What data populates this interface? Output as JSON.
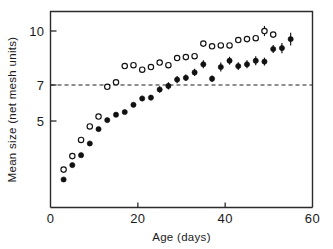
{
  "chart_data": {
    "type": "scatter",
    "title": "",
    "xlabel": "Age (days)",
    "ylabel": "Mean size (net mesh units)",
    "xlim": [
      0,
      60
    ],
    "ylim": [
      1.0,
      10.6
    ],
    "xticks": [
      0,
      20,
      40,
      60
    ],
    "xticklabels": [
      "0",
      "20",
      "40",
      "60"
    ],
    "yticks": [
      5,
      7,
      10
    ],
    "yticklabels": [
      "5",
      "7",
      "10"
    ],
    "grid": false,
    "legend": "none",
    "annotations": [
      {
        "kind": "horizontal-reference-line",
        "y": 7,
        "style": "dashed",
        "label": "7"
      }
    ],
    "series": [
      {
        "name": "open-circles",
        "marker": "open-circle",
        "color": "#111111",
        "points": [
          {
            "x": 3,
            "y": 2.3,
            "err": 0.0
          },
          {
            "x": 5,
            "y": 3.05,
            "err": 0.0
          },
          {
            "x": 7,
            "y": 3.95,
            "err": 0.0
          },
          {
            "x": 9,
            "y": 4.7,
            "err": 0.0
          },
          {
            "x": 11,
            "y": 5.25,
            "err": 0.0
          },
          {
            "x": 13,
            "y": 6.9,
            "err": 0.0
          },
          {
            "x": 15,
            "y": 7.15,
            "err": 0.0
          },
          {
            "x": 17,
            "y": 8.05,
            "err": 0.0
          },
          {
            "x": 19,
            "y": 8.1,
            "err": 0.0
          },
          {
            "x": 21,
            "y": 7.85,
            "err": 0.0
          },
          {
            "x": 23,
            "y": 8.0,
            "err": 0.0
          },
          {
            "x": 25,
            "y": 8.25,
            "err": 0.0
          },
          {
            "x": 27,
            "y": 8.1,
            "err": 0.0
          },
          {
            "x": 29,
            "y": 8.5,
            "err": 0.0
          },
          {
            "x": 31,
            "y": 8.55,
            "err": 0.0
          },
          {
            "x": 33,
            "y": 8.6,
            "err": 0.0
          },
          {
            "x": 35,
            "y": 9.3,
            "err": 0.0
          },
          {
            "x": 37,
            "y": 9.15,
            "err": 0.0
          },
          {
            "x": 39,
            "y": 9.2,
            "err": 0.0
          },
          {
            "x": 41,
            "y": 9.2,
            "err": 0.0
          },
          {
            "x": 43,
            "y": 9.5,
            "err": 0.0
          },
          {
            "x": 45,
            "y": 9.55,
            "err": 0.0
          },
          {
            "x": 47,
            "y": 9.6,
            "err": 0.0
          },
          {
            "x": 49,
            "y": 10.0,
            "err": 0.28
          },
          {
            "x": 51,
            "y": 9.8,
            "err": 0.0
          }
        ]
      },
      {
        "name": "filled-circles",
        "marker": "filled-circle",
        "color": "#111111",
        "points": [
          {
            "x": 3,
            "y": 1.75,
            "err": 0.0
          },
          {
            "x": 5,
            "y": 2.55,
            "err": 0.0
          },
          {
            "x": 7,
            "y": 3.1,
            "err": 0.0
          },
          {
            "x": 9,
            "y": 3.75,
            "err": 0.0
          },
          {
            "x": 11,
            "y": 4.55,
            "err": 0.0
          },
          {
            "x": 13,
            "y": 5.05,
            "err": 0.0
          },
          {
            "x": 15,
            "y": 5.35,
            "err": 0.0
          },
          {
            "x": 17,
            "y": 5.5,
            "err": 0.0
          },
          {
            "x": 19,
            "y": 5.9,
            "err": 0.12
          },
          {
            "x": 21,
            "y": 6.25,
            "err": 0.15
          },
          {
            "x": 23,
            "y": 6.3,
            "err": 0.15
          },
          {
            "x": 25,
            "y": 6.75,
            "err": 0.18
          },
          {
            "x": 27,
            "y": 6.95,
            "err": 0.2
          },
          {
            "x": 29,
            "y": 7.3,
            "err": 0.2
          },
          {
            "x": 31,
            "y": 7.4,
            "err": 0.18
          },
          {
            "x": 33,
            "y": 7.7,
            "err": 0.2
          },
          {
            "x": 35,
            "y": 8.15,
            "err": 0.22
          },
          {
            "x": 37,
            "y": 7.35,
            "err": 0.18
          },
          {
            "x": 39,
            "y": 8.0,
            "err": 0.25
          },
          {
            "x": 41,
            "y": 8.35,
            "err": 0.22
          },
          {
            "x": 43,
            "y": 8.05,
            "err": 0.22
          },
          {
            "x": 45,
            "y": 8.15,
            "err": 0.22
          },
          {
            "x": 47,
            "y": 8.35,
            "err": 0.25
          },
          {
            "x": 49,
            "y": 8.3,
            "err": 0.22
          },
          {
            "x": 51,
            "y": 9.0,
            "err": 0.22
          },
          {
            "x": 53,
            "y": 9.05,
            "err": 0.28
          },
          {
            "x": 55,
            "y": 9.55,
            "err": 0.35
          }
        ]
      }
    ]
  }
}
